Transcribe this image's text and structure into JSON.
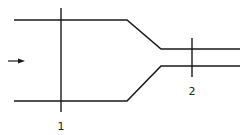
{
  "diagram": {
    "title": "",
    "section_labels": [
      {
        "id": "section-1",
        "text": "1"
      },
      {
        "id": "section-2",
        "text": "2"
      }
    ],
    "flow_direction": "left-to-right",
    "elements": [
      "converging pipe / nozzle",
      "flow arrow",
      "section line 1 (wide)",
      "section line 2 (narrow)"
    ],
    "colors": {
      "line": "#1a1a1a",
      "background": "#ffffff"
    }
  }
}
